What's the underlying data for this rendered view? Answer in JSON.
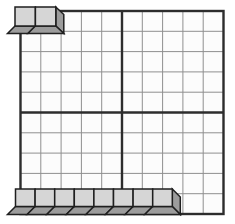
{
  "figure": {
    "name": "ten-by-ten-grid-with-unit-cubes",
    "colors": {
      "background": "#ffffff",
      "cell_fill": "#fcfcfc",
      "grid_thin": "#8f8f8f",
      "grid_thick": "#2d2d2d",
      "cube_face": "#d6d6d6",
      "cube_dark": "#9c9c9c",
      "cube_outline": "#1f1f1f"
    },
    "grid": {
      "x": 20.5,
      "y": 11,
      "cols": 10,
      "rows": 10,
      "cell": 20.3,
      "thick_every": 5,
      "thin_width": 1,
      "thick_width": 2.4
    },
    "cube_runs": [
      {
        "name": "top-left-cubes",
        "count": 2,
        "x": 15,
        "y": 7,
        "cube_width": 20.4,
        "cube_height": 19,
        "depth": 7.5,
        "side_width": 8
      },
      {
        "name": "bottom-cubes",
        "count": 8,
        "x": 15.5,
        "y": 189,
        "cube_width": 19.6,
        "cube_height": 17.5,
        "depth": 8,
        "side_width": 8
      }
    ],
    "counts": {
      "top_left_cubes": 2,
      "bottom_cubes": 8,
      "total_cubes": 10,
      "grid_cells": 100
    }
  }
}
